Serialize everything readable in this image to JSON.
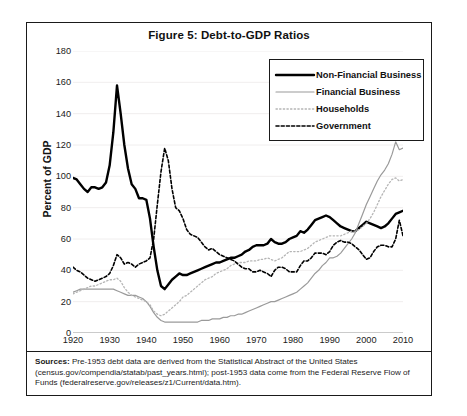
{
  "figure": {
    "title": "Figure 5: Debt-to-GDP Ratios",
    "source_label": "Sources:",
    "source_text": " Pre-1953 debt data are derived from the Statistical Abstract of the United States (census.gov/compendia/statab/past_years.html); post-1953 data come from the Federal Reserve Flow of Funds (federalreserve.gov/releases/z1/Current/data.htm)."
  },
  "legend": {
    "position": "top-right",
    "items": [
      {
        "label": "Non-Financial Business",
        "key": "solid-thick-black",
        "color": "#000000"
      },
      {
        "label": "Financial Business",
        "key": "solid-thin-gray",
        "color": "#9a9a9a"
      },
      {
        "label": "Households",
        "key": "dotted-light-gray",
        "color": "#b5b5b5"
      },
      {
        "label": "Government",
        "key": "dashed-black",
        "color": "#000000"
      }
    ]
  },
  "chart_data": {
    "type": "line",
    "title": "Figure 5: Debt-to-GDP Ratios",
    "xlabel": "",
    "ylabel": "Percent of GDP",
    "xlim": [
      1920,
      2010
    ],
    "ylim": [
      0,
      180
    ],
    "ytick_values": [
      0,
      20,
      40,
      60,
      80,
      100,
      120,
      140,
      160,
      180
    ],
    "ytick_labels": [
      "0",
      "20",
      "40",
      "60",
      "80",
      "100",
      "120",
      "140",
      "160",
      "180"
    ],
    "xtick_values": [
      1920,
      1930,
      1940,
      1950,
      1960,
      1970,
      1980,
      1990,
      2000,
      2010
    ],
    "xtick_labels": [
      "1920",
      "1930",
      "1940",
      "1950",
      "1960",
      "1970",
      "1980",
      "1990",
      "2000",
      "2010"
    ],
    "grid": "horizontal-light",
    "x": [
      1920,
      1921,
      1922,
      1923,
      1924,
      1925,
      1926,
      1927,
      1928,
      1929,
      1930,
      1931,
      1932,
      1933,
      1934,
      1935,
      1936,
      1937,
      1938,
      1939,
      1940,
      1941,
      1942,
      1943,
      1944,
      1945,
      1946,
      1947,
      1948,
      1949,
      1950,
      1951,
      1952,
      1953,
      1954,
      1955,
      1956,
      1957,
      1958,
      1959,
      1960,
      1961,
      1962,
      1963,
      1964,
      1965,
      1966,
      1967,
      1968,
      1969,
      1970,
      1971,
      1972,
      1973,
      1974,
      1975,
      1976,
      1977,
      1978,
      1979,
      1980,
      1981,
      1982,
      1983,
      1984,
      1985,
      1986,
      1987,
      1988,
      1989,
      1990,
      1991,
      1992,
      1993,
      1994,
      1995,
      1996,
      1997,
      1998,
      1999,
      2000,
      2001,
      2002,
      2003,
      2004,
      2005,
      2006,
      2007,
      2008,
      2009,
      2010
    ],
    "series": [
      {
        "name": "Non-Financial Business",
        "style": "solid",
        "width": 2.4,
        "color": "#000000",
        "values": [
          99,
          98,
          95,
          92,
          90,
          93,
          93,
          92,
          93,
          96,
          107,
          128,
          158,
          140,
          120,
          105,
          95,
          92,
          86,
          86,
          85,
          73,
          55,
          40,
          30,
          28,
          31,
          34,
          36,
          38,
          37,
          37,
          38,
          39,
          40,
          41,
          42,
          43,
          44,
          45,
          45,
          46,
          47,
          48,
          48,
          49,
          50,
          52,
          53,
          55,
          56,
          56,
          56,
          57,
          60,
          58,
          57,
          57,
          58,
          60,
          61,
          62,
          65,
          64,
          66,
          69,
          72,
          73,
          74,
          75,
          74,
          72,
          70,
          68,
          67,
          66,
          65,
          65,
          67,
          69,
          71,
          70,
          69,
          68,
          67,
          68,
          70,
          73,
          76,
          77,
          78
        ]
      },
      {
        "name": "Financial Business",
        "style": "solid",
        "width": 1.2,
        "color": "#9a9a9a",
        "values": [
          26,
          27,
          28,
          28,
          28,
          28,
          28,
          28,
          28,
          28,
          28,
          28,
          27,
          26,
          25,
          24,
          24,
          24,
          23,
          22,
          20,
          17,
          13,
          10,
          8,
          7,
          7,
          7,
          7,
          7,
          7,
          7,
          7,
          7,
          7,
          8,
          8,
          8,
          9,
          9,
          9,
          10,
          10,
          11,
          11,
          12,
          12,
          13,
          14,
          15,
          16,
          17,
          18,
          19,
          20,
          20,
          21,
          22,
          23,
          24,
          25,
          26,
          28,
          30,
          32,
          35,
          38,
          40,
          43,
          45,
          48,
          48,
          49,
          51,
          54,
          57,
          60,
          64,
          70,
          76,
          82,
          87,
          92,
          97,
          101,
          104,
          108,
          114,
          122,
          117,
          118
        ]
      },
      {
        "name": "Households",
        "style": "dotted",
        "width": 1.3,
        "color": "#b5b5b5",
        "values": [
          25,
          26,
          27,
          28,
          29,
          30,
          30,
          31,
          32,
          33,
          34,
          34,
          35,
          33,
          29,
          26,
          24,
          23,
          22,
          21,
          20,
          18,
          14,
          12,
          11,
          12,
          14,
          16,
          18,
          20,
          23,
          24,
          26,
          28,
          30,
          32,
          34,
          35,
          36,
          38,
          39,
          40,
          41,
          43,
          44,
          45,
          45,
          45,
          46,
          46,
          46,
          47,
          47,
          48,
          47,
          46,
          47,
          48,
          50,
          52,
          52,
          52,
          52,
          53,
          54,
          56,
          58,
          59,
          60,
          61,
          62,
          62,
          62,
          62,
          63,
          64,
          65,
          65,
          66,
          68,
          70,
          73,
          77,
          82,
          87,
          91,
          95,
          98,
          99,
          97,
          98
        ]
      },
      {
        "name": "Government",
        "style": "dashed",
        "width": 1.6,
        "color": "#000000",
        "values": [
          42,
          40,
          39,
          37,
          35,
          34,
          33,
          34,
          35,
          36,
          38,
          43,
          50,
          48,
          44,
          45,
          44,
          42,
          44,
          45,
          46,
          48,
          60,
          82,
          103,
          118,
          110,
          92,
          80,
          78,
          73,
          66,
          63,
          62,
          61,
          58,
          55,
          53,
          54,
          52,
          50,
          49,
          48,
          47,
          46,
          44,
          42,
          41,
          41,
          39,
          39,
          40,
          39,
          38,
          36,
          40,
          42,
          42,
          41,
          39,
          39,
          39,
          43,
          46,
          46,
          48,
          51,
          51,
          51,
          50,
          52,
          56,
          58,
          59,
          58,
          58,
          57,
          55,
          53,
          50,
          47,
          48,
          52,
          55,
          56,
          56,
          55,
          55,
          60,
          72,
          62
        ]
      }
    ]
  }
}
